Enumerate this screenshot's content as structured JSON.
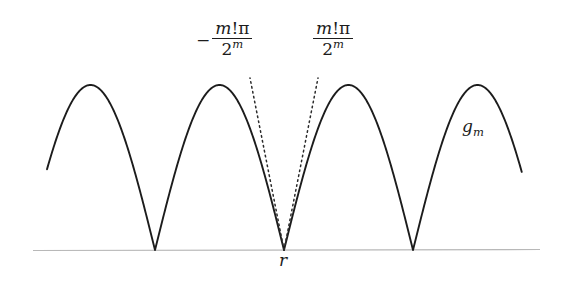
{
  "figure": {
    "kind": "math-plot",
    "background_color": "#ffffff",
    "curve_color": "#1c1c1c",
    "axis_color": "#b8b8b8",
    "tangent_color": "#2a2a2a"
  },
  "labels": {
    "left_slope": {
      "sign": "−",
      "numerator_italic": "m",
      "numerator_upright": "!π",
      "denominator_base": "2",
      "denominator_exponent": "m",
      "plain_text": "− m!π / 2^m"
    },
    "right_slope": {
      "sign": "",
      "numerator_italic": "m",
      "numerator_upright": "!π",
      "denominator_base": "2",
      "denominator_exponent": "m",
      "plain_text": "m!π / 2^m"
    },
    "curve_name": {
      "base": "g",
      "subscript": "m",
      "plain_text": "g_m"
    },
    "root_point": {
      "text": "r"
    }
  },
  "chart_data": {
    "type": "line",
    "title": "",
    "xlabel": "",
    "ylabel": "",
    "grid": false,
    "legend": "none",
    "axis": {
      "baseline_y_px": 250,
      "x_start_px": 33,
      "x_end_px": 540,
      "visible": true
    },
    "cusps_px": [
      155,
      284,
      413
    ],
    "peaks_px": [
      {
        "x": 93,
        "y": 85
      },
      {
        "x": 219,
        "y": 85
      },
      {
        "x": 348,
        "y": 85
      },
      {
        "x": 477,
        "y": 85
      }
    ],
    "curve_start_px": {
      "x": 47,
      "y": 167
    },
    "curve_end_px": {
      "x": 522,
      "y": 163
    },
    "period_px": 129,
    "amplitude_px": 165,
    "tangents": [
      {
        "name": "left-tangent",
        "from_px": {
          "x": 284,
          "y": 250
        },
        "to_px": {
          "x": 250,
          "y": 78
        },
        "slope_label": "− m!π / 2^m",
        "style": "dotted"
      },
      {
        "name": "right-tangent",
        "from_px": {
          "x": 284,
          "y": 250
        },
        "to_px": {
          "x": 318,
          "y": 78
        },
        "slope_label": "m!π / 2^m",
        "style": "dotted"
      }
    ]
  }
}
